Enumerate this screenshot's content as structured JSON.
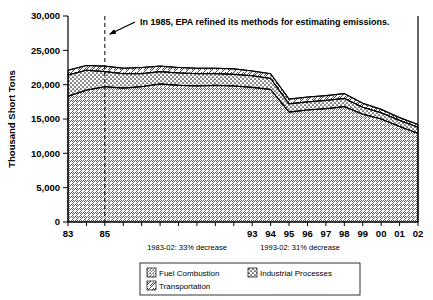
{
  "chart_data": {
    "type": "area",
    "title": "",
    "xlabel": "",
    "ylabel": "Thousand Short Tons",
    "ylim": [
      0,
      30000
    ],
    "yticks": [
      "0",
      "5,000",
      "10,000",
      "15,000",
      "20,000",
      "25,000",
      "30,000"
    ],
    "ytick_values": [
      0,
      5000,
      10000,
      15000,
      20000,
      25000,
      30000
    ],
    "grid": false,
    "stacked": true,
    "legend_position": "bottom",
    "x": [
      1983,
      1984,
      1985,
      1986,
      1987,
      1988,
      1989,
      1990,
      1991,
      1992,
      1993,
      1994,
      1995,
      1996,
      1997,
      1998,
      1999,
      2000,
      2001,
      2002
    ],
    "categories": [
      "83",
      "84",
      "85",
      "86",
      "87",
      "88",
      "89",
      "90",
      "91",
      "92",
      "93",
      "94",
      "95",
      "96",
      "97",
      "98",
      "99",
      "00",
      "01",
      "02"
    ],
    "xtick_labels": [
      {
        "category": "83",
        "label": "83"
      },
      {
        "category": "84",
        "label": ""
      },
      {
        "category": "85",
        "label": "85"
      },
      {
        "category": "86",
        "label": ""
      },
      {
        "category": "87",
        "label": ""
      },
      {
        "category": "88",
        "label": ""
      },
      {
        "category": "89",
        "label": ""
      },
      {
        "category": "90",
        "label": ""
      },
      {
        "category": "91",
        "label": ""
      },
      {
        "category": "92",
        "label": ""
      },
      {
        "category": "93",
        "label": "93"
      },
      {
        "category": "94",
        "label": "94"
      },
      {
        "category": "95",
        "label": "95"
      },
      {
        "category": "96",
        "label": "96"
      },
      {
        "category": "97",
        "label": "97"
      },
      {
        "category": "98",
        "label": "98"
      },
      {
        "category": "99",
        "label": "99"
      },
      {
        "category": "00",
        "label": "00"
      },
      {
        "category": "01",
        "label": "01"
      },
      {
        "category": "02",
        "label": "02"
      }
    ],
    "series": [
      {
        "name": "Fuel Combustion",
        "pattern": "fine-diagonal-hatch",
        "values": [
          18300,
          19200,
          19700,
          19500,
          19700,
          20100,
          19900,
          19800,
          19900,
          19800,
          19600,
          19300,
          16000,
          16300,
          16500,
          16800,
          15700,
          15000,
          13900,
          12900
        ]
      },
      {
        "name": "Industrial Processes",
        "pattern": "dotted",
        "values": [
          3100,
          2900,
          2200,
          2100,
          1900,
          1800,
          1800,
          1800,
          1700,
          1700,
          1700,
          1600,
          1200,
          1200,
          1200,
          1200,
          1000,
          900,
          900,
          900
        ]
      },
      {
        "name": "Transportation",
        "pattern": "coarse-diagonal",
        "values": [
          700,
          700,
          800,
          800,
          900,
          800,
          800,
          800,
          800,
          800,
          700,
          700,
          700,
          700,
          700,
          700,
          600,
          500,
          400,
          400
        ]
      }
    ],
    "totals": [
      22100,
      22800,
      22700,
      22400,
      22500,
      22700,
      22500,
      22400,
      22400,
      22300,
      22000,
      21600,
      17900,
      18200,
      18400,
      18700,
      17300,
      16400,
      15200,
      14200
    ],
    "annotations": [
      {
        "id": "epa-note",
        "text": "In 1985, EPA refined its methods for estimating emissions.",
        "marker_year": 1985,
        "marker_style": "dashed-vertical-line",
        "arrow": true
      }
    ],
    "footnotes": [
      "1983-02: 33% decrease",
      "1993-02: 31% decrease"
    ]
  },
  "legend": {
    "items": [
      {
        "label": "Fuel Combustion",
        "pattern": "fine-diagonal-hatch"
      },
      {
        "label": "Industrial Processes",
        "pattern": "dotted"
      },
      {
        "label": "Transportation",
        "pattern": "coarse-diagonal"
      }
    ]
  }
}
